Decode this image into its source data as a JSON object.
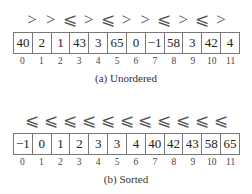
{
  "figures": [
    {
      "caption": "(a) Unordered",
      "relations": [
        ">",
        ">",
        "⩽",
        ">",
        "⩽",
        ">",
        ">",
        "⩽",
        ">",
        "⩽",
        ">"
      ],
      "values": [
        "40",
        "2",
        "1",
        "43",
        "3",
        "65",
        "0",
        "−1",
        "58",
        "3",
        "42",
        "4"
      ],
      "indices": [
        "0",
        "1",
        "2",
        "3",
        "4",
        "5",
        "6",
        "7",
        "8",
        "9",
        "10",
        "11"
      ]
    },
    {
      "caption": "(b) Sorted",
      "relations": [
        "⩽",
        "⩽",
        "⩽",
        "⩽",
        "⩽",
        "⩽",
        "⩽",
        "⩽",
        "⩽",
        "⩽",
        "⩽"
      ],
      "values": [
        "−1",
        "0",
        "1",
        "2",
        "3",
        "3",
        "4",
        "40",
        "42",
        "43",
        "58",
        "65"
      ],
      "indices": [
        "0",
        "1",
        "2",
        "3",
        "4",
        "5",
        "6",
        "7",
        "8",
        "9",
        "10",
        "11"
      ]
    }
  ]
}
